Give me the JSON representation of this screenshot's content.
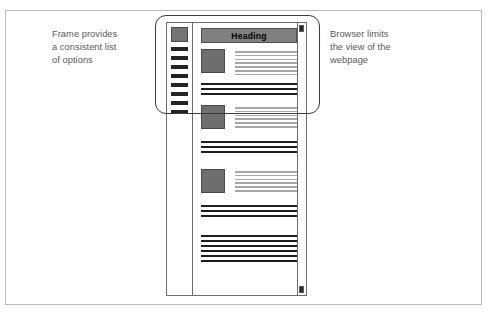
{
  "figure": {
    "annotations": {
      "left": "Frame provides\na consistent list\nof options",
      "right": "Browser limits\nthe view of the\nwebpage"
    }
  },
  "webpage": {
    "heading": "Heading",
    "sidebar": {
      "logo_name": "site-logo-placeholder",
      "items": [
        {
          "label": ""
        },
        {
          "label": ""
        },
        {
          "label": ""
        },
        {
          "label": ""
        },
        {
          "label": ""
        },
        {
          "label": ""
        },
        {
          "label": ""
        },
        {
          "label": ""
        }
      ]
    },
    "articles": [
      {
        "media": "image-placeholder",
        "text_lines": 7,
        "rules": 3
      },
      {
        "media": "image-placeholder",
        "text_lines": 6,
        "rules": 3
      },
      {
        "media": "image-placeholder",
        "text_lines": 6,
        "rules": 3
      }
    ],
    "footer_rules": 6,
    "scrollbar": {
      "up_arrow": "scroll-up",
      "down_arrow": "scroll-down"
    }
  },
  "colors": {
    "heading_band": "#808080",
    "media_placeholder": "#6e6e6e",
    "text_line": "#a6a6a6",
    "rule_line": "#1d1d1d",
    "sidebar_item": "#232323",
    "frame_border": "#6d6d6d",
    "callout_border": "#3c3c3c",
    "annotation_text": "#58595b"
  }
}
